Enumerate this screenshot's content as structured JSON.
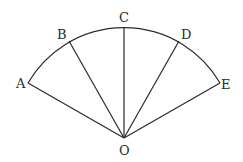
{
  "diagram": {
    "type": "sector",
    "center": {
      "label": "O",
      "x": 124,
      "y": 138
    },
    "radius": 111,
    "points": [
      {
        "label": "A",
        "x": 28,
        "y": 83
      },
      {
        "label": "B",
        "x": 69,
        "y": 41
      },
      {
        "label": "C",
        "x": 124,
        "y": 27
      },
      {
        "label": "D",
        "x": 179,
        "y": 41
      },
      {
        "label": "E",
        "x": 220,
        "y": 83
      }
    ],
    "labels": {
      "A": "A",
      "B": "B",
      "C": "C",
      "D": "D",
      "E": "E",
      "O": "O"
    },
    "colors": {
      "stroke": "#2a2a2a",
      "background": "#ffffff"
    }
  }
}
